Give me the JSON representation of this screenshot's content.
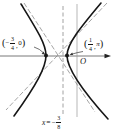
{
  "figure": {
    "type": "hyperbola-with-asymptotes-and-directrix",
    "colors": {
      "curve": "#161616",
      "axis": "#555555",
      "guide": "#8a8a8a",
      "text": "#161616",
      "background": "#ffffff"
    },
    "labels": {
      "left_vertex": {
        "open": "(",
        "minus": "−",
        "num": "3",
        "den": "4",
        "sep": ",",
        "second": "0",
        "close": ")"
      },
      "right_vertex": {
        "open": "(",
        "num": "1",
        "den": "4",
        "sep": ",",
        "second": "π",
        "close": ")"
      },
      "origin": "O",
      "directrix": {
        "var": "x",
        "eq": "=",
        "minus": "−",
        "num": "3",
        "den": "8"
      }
    }
  }
}
